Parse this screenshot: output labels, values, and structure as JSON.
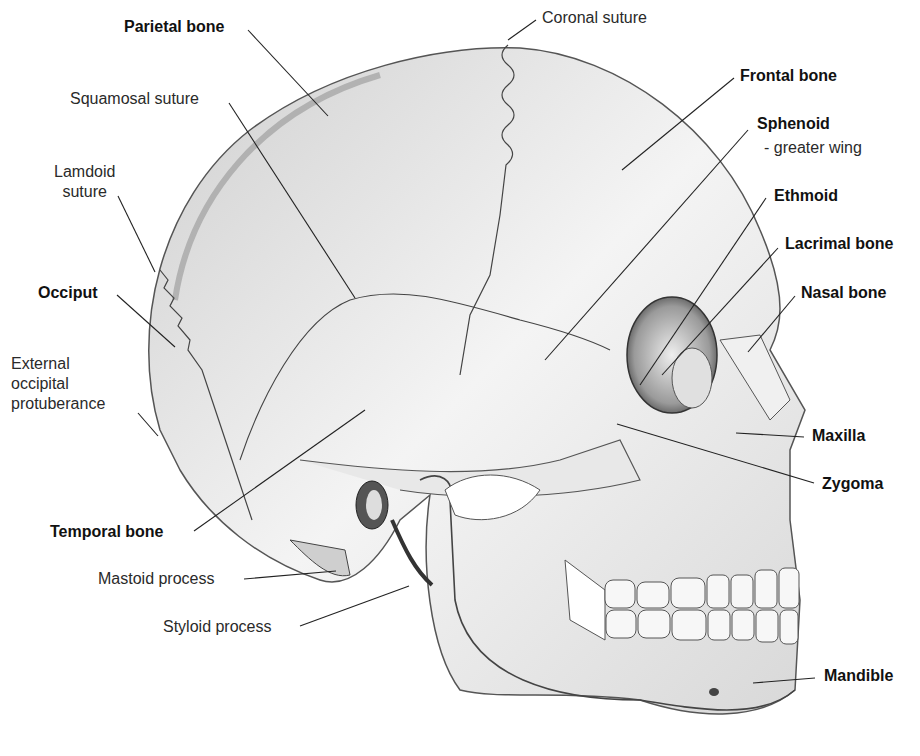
{
  "diagram": {
    "labels": [
      {
        "id": "parietal-bone",
        "text": "Parietal bone",
        "bold": true,
        "x": 124,
        "y": 17,
        "line": [
          248,
          30,
          328,
          116
        ]
      },
      {
        "id": "coronal-suture",
        "text": "Coronal suture",
        "bold": false,
        "x": 542,
        "y": 8,
        "line": [
          536,
          20,
          508,
          40
        ]
      },
      {
        "id": "squamosal-suture",
        "text": "Squamosal suture",
        "bold": false,
        "x": 70,
        "y": 89,
        "line": [
          229,
          103,
          355,
          298
        ]
      },
      {
        "id": "frontal-bone",
        "text": "Frontal bone",
        "bold": true,
        "x": 740,
        "y": 66,
        "line": [
          734,
          78,
          622,
          170
        ]
      },
      {
        "id": "sphenoid",
        "text": "Sphenoid",
        "bold": true,
        "x": 757,
        "y": 114,
        "line": [
          748,
          130,
          545,
          360
        ]
      },
      {
        "id": "sphenoid-sub",
        "text": "- greater wing",
        "bold": false,
        "x": 764,
        "y": 138,
        "line": null
      },
      {
        "id": "lamdoid-suture",
        "text": "Lamdoid\nsuture",
        "bold": false,
        "x": 54,
        "y": 162,
        "line": [
          118,
          196,
          155,
          272
        ]
      },
      {
        "id": "ethmoid",
        "text": "Ethmoid",
        "bold": true,
        "x": 774,
        "y": 186,
        "line": [
          766,
          198,
          640,
          385
        ]
      },
      {
        "id": "lacrimal-bone",
        "text": "Lacrimal bone",
        "bold": true,
        "x": 785,
        "y": 234,
        "line": [
          778,
          248,
          662,
          375
        ]
      },
      {
        "id": "occiput",
        "text": "Occiput",
        "bold": true,
        "x": 38,
        "y": 283,
        "line": [
          117,
          295,
          175,
          347
        ]
      },
      {
        "id": "nasal-bone",
        "text": "Nasal bone",
        "bold": true,
        "x": 801,
        "y": 283,
        "line": [
          795,
          296,
          748,
          352
        ]
      },
      {
        "id": "external-occipital-protuberance",
        "text": "External\noccipital\nprotuberance",
        "bold": false,
        "x": 11,
        "y": 354,
        "line": [
          138,
          413,
          158,
          436
        ]
      },
      {
        "id": "maxilla",
        "text": "Maxilla",
        "bold": true,
        "x": 812,
        "y": 426,
        "line": [
          804,
          437,
          736,
          433
        ]
      },
      {
        "id": "zygoma",
        "text": "Zygoma",
        "bold": true,
        "x": 822,
        "y": 474,
        "line": [
          814,
          483,
          617,
          424
        ]
      },
      {
        "id": "temporal-bone",
        "text": "Temporal bone",
        "bold": true,
        "x": 50,
        "y": 522,
        "line": [
          194,
          531,
          365,
          410
        ]
      },
      {
        "id": "mastoid-process",
        "text": "Mastoid process",
        "bold": false,
        "x": 98,
        "y": 569,
        "line": [
          244,
          579,
          336,
          571
        ]
      },
      {
        "id": "styloid-process",
        "text": "Styloid process",
        "bold": false,
        "x": 163,
        "y": 617,
        "line": [
          300,
          626,
          409,
          586
        ]
      },
      {
        "id": "mandible",
        "text": "Mandible",
        "bold": true,
        "x": 824,
        "y": 666,
        "line": [
          815,
          678,
          753,
          683
        ]
      }
    ]
  }
}
